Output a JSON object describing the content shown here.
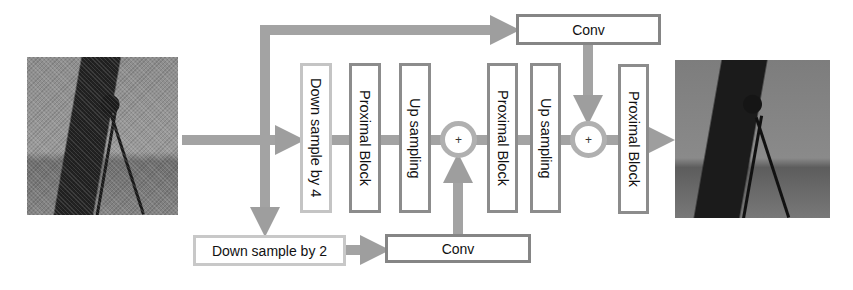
{
  "diagram": {
    "input_image": {
      "label": "Noisy cameraman image",
      "tone": "noisy"
    },
    "output_image": {
      "label": "Denoised cameraman image",
      "tone": "clean"
    },
    "blocks": {
      "down4": "Down sample by 4",
      "prox1": "Proximal Block",
      "up1": "Up sampling",
      "prox2": "Proximal Block",
      "up2": "Up sampling",
      "prox3": "Proximal Block",
      "down2": "Down sample by 2",
      "conv_bottom": "Conv",
      "conv_top": "Conv"
    },
    "sum_nodes": {
      "sum1": "+",
      "sum2": "+"
    },
    "colors": {
      "arrow": "#a0a0a0",
      "box_border": "#8c8c8c",
      "light_border": "#c6c6c6"
    }
  }
}
